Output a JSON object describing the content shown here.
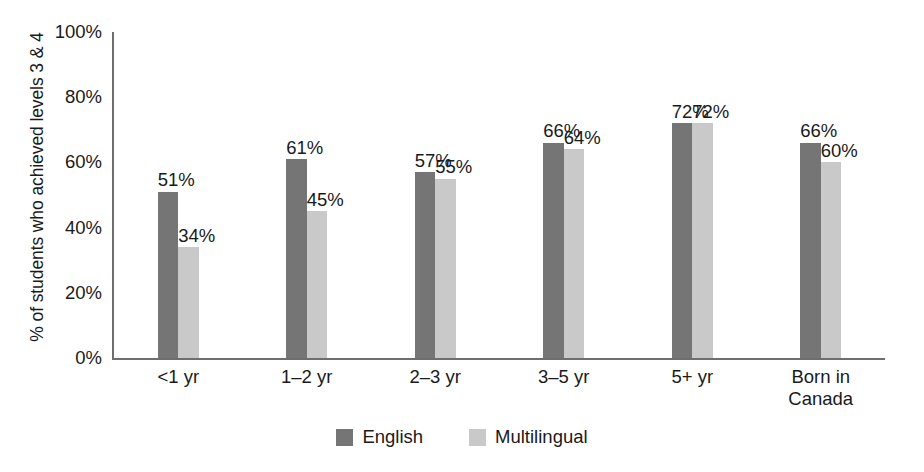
{
  "chart_data": {
    "type": "bar",
    "title": "",
    "xlabel": "",
    "ylabel": "% of students who achieved levels 3 & 4",
    "ylim": [
      0,
      100
    ],
    "grid": false,
    "legend_position": "bottom",
    "categories": [
      "<1 yr",
      "1–2 yr",
      "2–3 yr",
      "3–5 yr",
      "5+ yr",
      "Born in\nCanada"
    ],
    "ytick_labels": [
      "100%",
      "80%",
      "60%",
      "40%",
      "20%",
      "0%"
    ],
    "ytick_values": [
      100,
      80,
      60,
      40,
      20,
      0
    ],
    "series": [
      {
        "name": "English",
        "color": "#757575",
        "values": [
          51,
          61,
          57,
          66,
          72,
          66
        ],
        "data_labels": [
          "51%",
          "61%",
          "57%",
          "66%",
          "72%",
          "66%"
        ]
      },
      {
        "name": "Multilingual",
        "color": "#c9c9c9",
        "values": [
          34,
          45,
          55,
          64,
          72,
          60
        ],
        "data_labels": [
          "34%",
          "45%",
          "55%",
          "64%",
          "72%",
          "60%"
        ]
      }
    ]
  },
  "legend": {
    "items": [
      {
        "label": "English",
        "color": "#757575"
      },
      {
        "label": "Multilingual",
        "color": "#c9c9c9"
      }
    ]
  },
  "colors": {
    "english": "#757575",
    "multilingual": "#c9c9c9",
    "axis": "#6e6e6e",
    "text": "#1a1a1a",
    "background": "#ffffff"
  }
}
